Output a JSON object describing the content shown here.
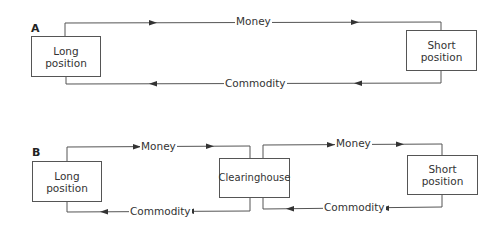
{
  "panels": [
    {
      "label": "A",
      "nodes": [
        {
          "id": "long",
          "label": "Long\nposition"
        },
        {
          "id": "short",
          "label": "Short\nposition"
        }
      ],
      "flows": [
        {
          "from": "long",
          "to": "short",
          "label": "Money"
        },
        {
          "from": "short",
          "to": "long",
          "label": "Commodity"
        }
      ]
    },
    {
      "label": "B",
      "nodes": [
        {
          "id": "long",
          "label": "Long\nposition"
        },
        {
          "id": "clearinghouse",
          "label": "Clearinghouse"
        },
        {
          "id": "short",
          "label": "Short\nposition"
        }
      ],
      "flows": [
        {
          "from": "long",
          "to": "clearinghouse",
          "label": "Money"
        },
        {
          "from": "clearinghouse",
          "to": "short",
          "label": "Money"
        },
        {
          "from": "short",
          "to": "clearinghouse",
          "label": "Commodity"
        },
        {
          "from": "clearinghouse",
          "to": "long",
          "label": "Commodity"
        }
      ]
    }
  ],
  "colors": {
    "line": "#555555",
    "text": "#333333"
  }
}
